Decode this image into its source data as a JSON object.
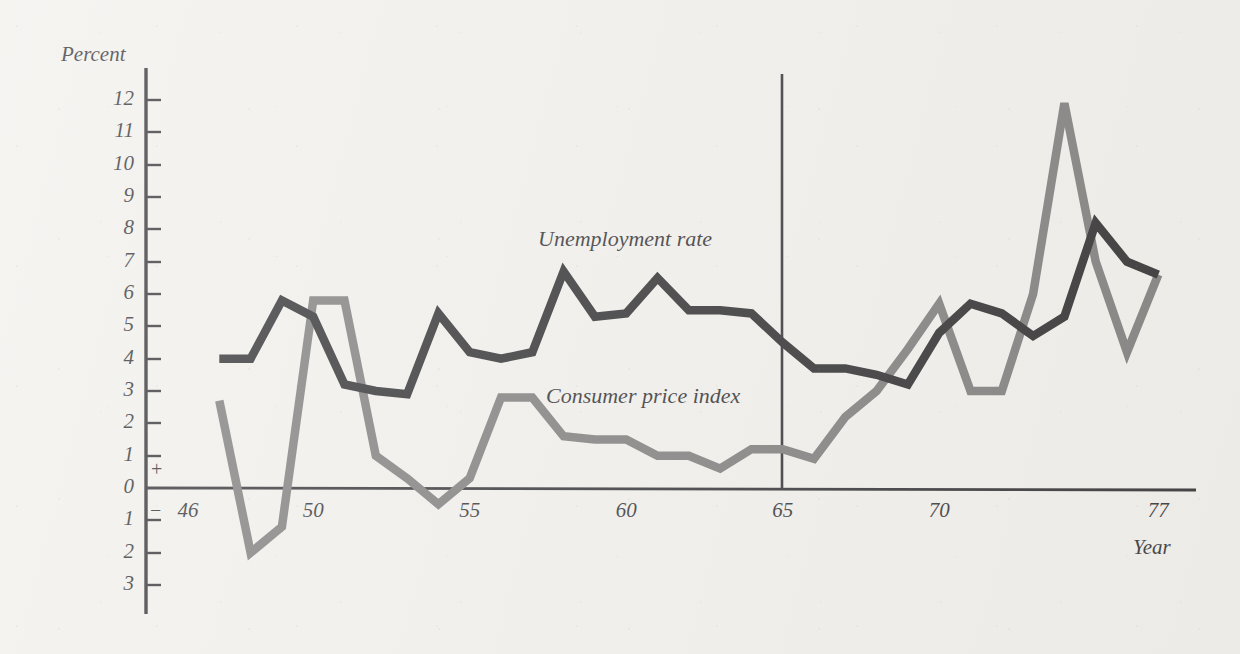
{
  "figure": {
    "y_axis_title": "Percent",
    "x_axis_title": "Year",
    "plus_sign": "+",
    "minus_sign": "−"
  },
  "chart_data": {
    "type": "line",
    "title": "",
    "xlabel": "Year",
    "ylabel": "Percent",
    "xlim": [
      46,
      77
    ],
    "ylim": [
      -3,
      12.5
    ],
    "grid": false,
    "legend_position": "inline-annotation",
    "x_tick_labels": [
      "46",
      "50",
      "55",
      "60",
      "65",
      "70",
      "77"
    ],
    "x_ticks": [
      46,
      50,
      55,
      60,
      65,
      70,
      77
    ],
    "y_tick_labels": [
      "12",
      "11",
      "10",
      "9",
      "8",
      "7",
      "6",
      "5",
      "4",
      "3",
      "2",
      "1",
      "0",
      "1",
      "2",
      "3"
    ],
    "y_ticks": [
      12,
      11,
      10,
      9,
      8,
      7,
      6,
      5,
      4,
      3,
      2,
      1,
      0,
      -1,
      -2,
      -3
    ],
    "annotations": [
      {
        "text": "Unemployment rate",
        "x": 60.5,
        "y": 7.8
      },
      {
        "text": "Consumer price index",
        "x": 60.8,
        "y": 3.1
      }
    ],
    "reference_line": {
      "x": 65,
      "orientation": "vertical",
      "label": ""
    },
    "x": [
      47,
      48,
      49,
      50,
      51,
      52,
      53,
      54,
      55,
      56,
      57,
      58,
      59,
      60,
      61,
      62,
      63,
      64,
      65,
      66,
      67,
      68,
      69,
      70,
      71,
      72,
      73,
      74,
      75,
      76,
      77
    ],
    "series": [
      {
        "name": "Unemployment rate",
        "color": "#141316",
        "values": [
          4.0,
          4.0,
          5.8,
          5.3,
          3.2,
          3.0,
          2.9,
          5.4,
          4.2,
          4.0,
          4.2,
          6.7,
          5.3,
          5.4,
          6.5,
          5.5,
          5.5,
          5.4,
          4.5,
          3.7,
          3.7,
          3.5,
          3.2,
          4.8,
          5.7,
          5.4,
          4.7,
          5.3,
          8.2,
          7.0,
          6.6
        ]
      },
      {
        "name": "Consumer price index",
        "color": "#6d6c6c",
        "values": [
          2.7,
          -2.0,
          -1.2,
          5.8,
          5.8,
          1.0,
          0.3,
          -0.5,
          0.3,
          2.8,
          2.8,
          1.6,
          1.5,
          1.5,
          1.0,
          1.0,
          0.6,
          1.2,
          1.2,
          0.9,
          2.2,
          3.0,
          4.3,
          5.7,
          3.0,
          3.0,
          6.0,
          11.9,
          7.0,
          4.2,
          6.6
        ]
      }
    ]
  }
}
